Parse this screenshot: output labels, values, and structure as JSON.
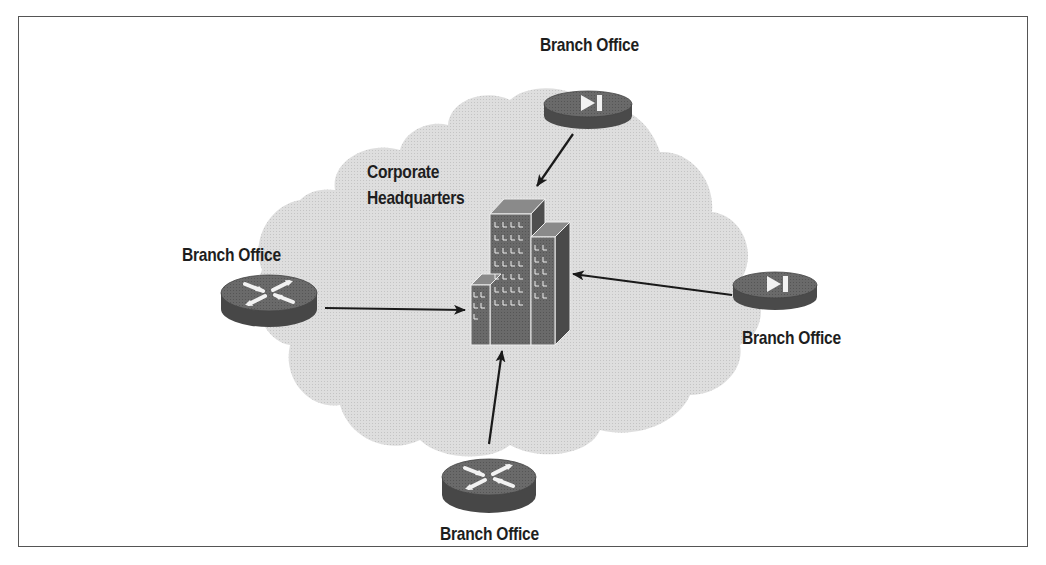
{
  "figure": {
    "caption_partial": "Figure — (caption cut off at top edge)",
    "cloud_label": "",
    "hub": {
      "label_line1": "Corporate",
      "label_line2": "Headquarters",
      "icon": "building-icon"
    },
    "branches": [
      {
        "position": "top",
        "label": "Branch Office",
        "icon": "vpn-concentrator-icon",
        "arrow_to": "hub"
      },
      {
        "position": "left",
        "label": "Branch Office",
        "icon": "router-icon",
        "arrow_to": "hub"
      },
      {
        "position": "right",
        "label": "Branch Office",
        "icon": "vpn-concentrator-icon",
        "arrow_to": "hub"
      },
      {
        "position": "bottom",
        "label": "Branch Office",
        "icon": "router-icon",
        "arrow_to": "hub"
      }
    ],
    "colors": {
      "frame": "#555555",
      "cloud": "#dcdcdc",
      "device_top": "#7a7a7a",
      "device_side": "#4a4a4a",
      "building": "#6e6e6e",
      "arrow": "#1a1a1a",
      "text": "#1e1e1e"
    }
  }
}
